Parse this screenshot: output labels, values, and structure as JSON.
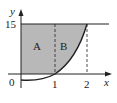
{
  "diagram": {
    "axes": {
      "x_label": "x",
      "y_label": "y",
      "origin_label": "0"
    },
    "ticks": {
      "x": [
        "1",
        "2"
      ],
      "y": [
        "15"
      ]
    },
    "regions": [
      {
        "label": "A",
        "x_range": [
          0,
          1
        ]
      },
      {
        "label": "B",
        "x_range": [
          1,
          2
        ]
      }
    ],
    "curve": "y = x^4 - 1",
    "horizontal_line": "y = 15",
    "colors": {
      "shade": "#b8b8b8",
      "line": "#222222"
    }
  }
}
